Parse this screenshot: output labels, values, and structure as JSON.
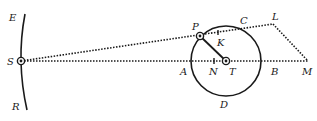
{
  "diagram": {
    "type": "geometric-figure",
    "labels": {
      "E": "E",
      "S": "S",
      "R": "R",
      "P": "P",
      "C": "C",
      "L": "L",
      "K": "K",
      "A": "A",
      "N": "N",
      "T": "T",
      "B": "B",
      "M": "M",
      "D": "D"
    },
    "colors": {
      "stroke": "#1a1a1a",
      "background": "#ffffff"
    }
  }
}
